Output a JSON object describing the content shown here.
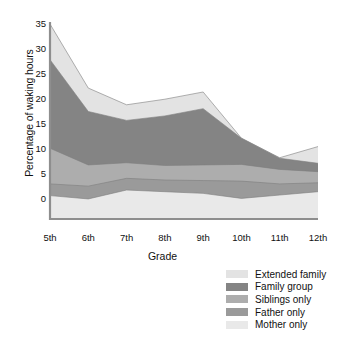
{
  "chart_data": {
    "type": "area",
    "title": "",
    "xlabel": "Grade",
    "ylabel": "Percentage of waking hours",
    "stacked": true,
    "grid": false,
    "legend_position": "bottom-right",
    "categories": [
      "5th",
      "6th",
      "7th",
      "8th",
      "9th",
      "10th",
      "11th",
      "12th"
    ],
    "x": [
      "5th",
      "6th",
      "7th",
      "8th",
      "9th",
      "10th",
      "11th",
      "12th"
    ],
    "ylim": [
      0,
      35
    ],
    "yticks": [
      0,
      5,
      10,
      15,
      20,
      25,
      30,
      35
    ],
    "ytick_labels": [
      "0",
      "5",
      "10",
      "15",
      "20",
      "25",
      "30",
      "35"
    ],
    "series": [
      {
        "name": "Mother only",
        "color": "#e9e9e9",
        "values": [
          4.2,
          3.6,
          5.2,
          4.9,
          4.6,
          3.7,
          4.3,
          4.9
        ]
      },
      {
        "name": "Father only",
        "color": "#9a9a9a",
        "values": [
          2.1,
          2.3,
          2.1,
          2.1,
          2.3,
          3.1,
          2.0,
          1.6
        ]
      },
      {
        "name": "Siblings only",
        "color": "#adadad",
        "values": [
          6.4,
          3.8,
          2.8,
          2.6,
          2.8,
          3.0,
          2.6,
          2.0
        ]
      },
      {
        "name": "Family group",
        "color": "#848484",
        "values": [
          15.9,
          9.6,
          7.6,
          8.9,
          10.1,
          4.7,
          2.0,
          1.5
        ]
      },
      {
        "name": "Extended family",
        "color": "#e3e3e3",
        "values": [
          6.4,
          4.2,
          2.8,
          3.0,
          3.0,
          0.0,
          0.1,
          3.0
        ]
      }
    ],
    "cumulative_totals": [
      35.0,
      23.5,
      20.5,
      21.5,
      22.8,
      14.5,
      11.0,
      13.0
    ],
    "colors": {
      "extended_family": "#e3e3e3",
      "family_group": "#848484",
      "siblings_only": "#adadad",
      "father_only": "#9a9a9a",
      "mother_only": "#e9e9e9",
      "axis": "#8e8e8e",
      "text": "#111111",
      "background": "#ffffff"
    }
  },
  "legend": {
    "items": [
      {
        "label": "Extended family",
        "color": "#e3e3e3"
      },
      {
        "label": "Family group",
        "color": "#848484"
      },
      {
        "label": "Siblings only",
        "color": "#adadad"
      },
      {
        "label": "Father only",
        "color": "#9a9a9a"
      },
      {
        "label": "Mother only",
        "color": "#e9e9e9"
      }
    ]
  },
  "axes": {
    "y_title": "Percentage of waking hours",
    "x_title": "Grade",
    "y_labels": [
      "35",
      "30",
      "25",
      "20",
      "15",
      "10",
      "5",
      "0"
    ],
    "x_labels": [
      "5th",
      "6th",
      "7th",
      "8th",
      "9th",
      "10th",
      "11th",
      "12th"
    ]
  }
}
